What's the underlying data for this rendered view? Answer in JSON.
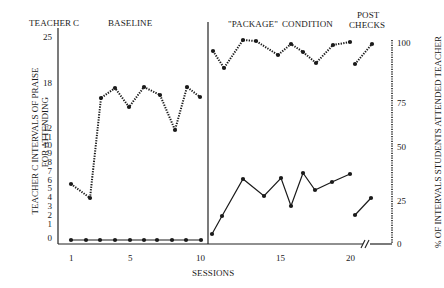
{
  "chart_data": {
    "type": "line",
    "title": "TEACHER C",
    "phases": [
      {
        "label": "BASELINE",
        "sessions": [
          1,
          10
        ]
      },
      {
        "label": "\"PACKAGE\" CONDITION",
        "sessions": [
          11,
          20
        ]
      },
      {
        "label": "POST CHECKS",
        "sessions": [
          "post1",
          "post2"
        ]
      }
    ],
    "xlabel": "SESSIONS",
    "xticks": [
      1,
      5,
      10,
      15,
      20
    ],
    "ylabel_left": "TEACHER C INTERVALS OF PRAISE FOR ATTENDING",
    "yticks_left": [
      0,
      1,
      2,
      3,
      4,
      5,
      6,
      7,
      8,
      9,
      10,
      11,
      12,
      18,
      25
    ],
    "ylabel_right": "% OF INTERVALS STUDENTS ATTENDED TEACHER",
    "yticks_right": [
      0,
      25,
      50,
      75,
      100
    ],
    "ylim_left": [
      0,
      25
    ],
    "ylim_right": [
      0,
      100
    ],
    "series": [
      {
        "name": "% of intervals students attended teacher",
        "style": "dotted",
        "axis": "right",
        "baseline": [
          33,
          27,
          65,
          69,
          61,
          70,
          67,
          52,
          70,
          66
        ],
        "package": [
          92,
          85,
          97,
          96,
          90,
          95,
          92,
          87,
          95,
          96
        ],
        "post_checks": [
          87,
          95
        ]
      },
      {
        "name": "Teacher C intervals of praise for attending",
        "style": "solid",
        "axis": "left",
        "baseline": [
          0,
          0,
          0,
          0,
          0,
          0,
          0,
          0,
          0,
          0
        ],
        "package": [
          0.5,
          2.5,
          6.5,
          4.5,
          6.5,
          3.5,
          7,
          5,
          6,
          7
        ],
        "post_checks": [
          2.5,
          4.5
        ]
      }
    ],
    "grid": false,
    "axis_break": "between session 20 and post checks"
  },
  "labels": {
    "teacher": "TEACHER",
    "teacher_id": "C",
    "baseline": "BASELINE",
    "package": "\"PACKAGE\"",
    "condition": "CONDITION",
    "post": "POST",
    "checks": "CHECKS",
    "sessions": "SESSIONS",
    "ylabel_left_1": "TEACHER C INTERVALS OF PRAISE",
    "ylabel_left_2": "FOR ATTENDING",
    "ylabel_right": "% OF INTERVALS STUDENTS ATTENDED TEACHER"
  },
  "ticks": {
    "left": [
      {
        "t": "25",
        "y": 33
      },
      {
        "t": "18",
        "y": 79
      },
      {
        "t": "12",
        "y": 124
      },
      {
        "t": "11",
        "y": 133
      },
      {
        "t": "10",
        "y": 141
      },
      {
        "t": "9",
        "y": 149
      },
      {
        "t": "8",
        "y": 158
      },
      {
        "t": "7",
        "y": 167
      },
      {
        "t": "6",
        "y": 176
      },
      {
        "t": "5",
        "y": 184
      },
      {
        "t": "4",
        "y": 193
      },
      {
        "t": "3",
        "y": 202
      },
      {
        "t": "2",
        "y": 211
      },
      {
        "t": "1",
        "y": 220
      },
      {
        "t": "0",
        "y": 234
      }
    ],
    "right": [
      {
        "t": "100",
        "y": 39
      },
      {
        "t": "75",
        "y": 99
      },
      {
        "t": "50",
        "y": 143
      },
      {
        "t": "25",
        "y": 197
      },
      {
        "t": "0",
        "y": 240
      }
    ],
    "bottom": [
      {
        "t": "1",
        "x": 69
      },
      {
        "t": "5",
        "x": 128
      },
      {
        "t": "10",
        "x": 196
      },
      {
        "t": "15",
        "x": 276
      },
      {
        "t": "20",
        "x": 346
      }
    ]
  },
  "pixels": {
    "dotted": [
      [
        [
          71,
          184
        ],
        [
          90,
          198
        ],
        [
          101,
          98
        ],
        [
          115,
          88
        ],
        [
          129,
          107
        ],
        [
          144,
          87
        ],
        [
          160,
          95
        ],
        [
          175,
          130
        ],
        [
          187,
          87
        ],
        [
          200,
          97
        ]
      ],
      [
        [
          213,
          51
        ],
        [
          224,
          68
        ],
        [
          243,
          40
        ],
        [
          256,
          41
        ],
        [
          278,
          55
        ],
        [
          291,
          44
        ],
        [
          303,
          52
        ],
        [
          316,
          63
        ],
        [
          333,
          45
        ],
        [
          350,
          42
        ]
      ],
      [
        [
          355,
          64
        ],
        [
          372,
          44
        ]
      ]
    ],
    "solid": [
      [
        [
          71,
          240
        ],
        [
          86,
          240
        ],
        [
          100,
          240
        ],
        [
          115,
          240
        ],
        [
          130,
          240
        ],
        [
          144,
          240
        ],
        [
          157,
          240
        ],
        [
          172,
          240
        ],
        [
          186,
          240
        ],
        [
          201,
          240
        ]
      ],
      [
        [
          212,
          234
        ],
        [
          222,
          216
        ],
        [
          243,
          179
        ],
        [
          264,
          196
        ],
        [
          281,
          178
        ],
        [
          291,
          206
        ],
        [
          303,
          173
        ],
        [
          315,
          190
        ],
        [
          332,
          182
        ],
        [
          350,
          174
        ]
      ],
      [
        [
          355,
          215
        ],
        [
          371,
          198
        ]
      ]
    ]
  }
}
